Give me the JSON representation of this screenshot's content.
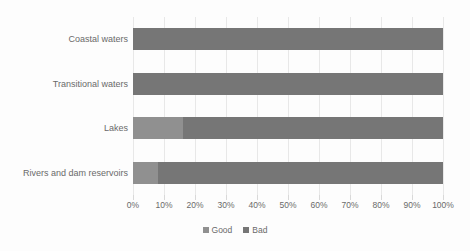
{
  "chart_data": {
    "type": "bar",
    "subtype": "stacked-horizontal-100-percent",
    "title": "",
    "subtitle": "",
    "xlabel": "",
    "ylabel": "",
    "xlim": [
      0,
      100
    ],
    "grid": true,
    "legend_position": "bottom-center",
    "categories": [
      "Coastal waters",
      "Transitional waters",
      "Lakes",
      "Rivers and dam reservoirs"
    ],
    "series": [
      {
        "name": "Good",
        "color": "#909090",
        "values": [
          0,
          0,
          16,
          8
        ]
      },
      {
        "name": "Bad",
        "color": "#767676",
        "values": [
          100,
          100,
          84,
          92
        ]
      }
    ],
    "xticks": [
      0,
      10,
      20,
      30,
      40,
      50,
      60,
      70,
      80,
      90,
      100
    ],
    "xtick_labels": [
      "0%",
      "10%",
      "20%",
      "30%",
      "40%",
      "50%",
      "60%",
      "70%",
      "80%",
      "90%",
      "100%"
    ]
  },
  "legend": {
    "items": [
      {
        "label": "Good",
        "color": "#909090",
        "marker": "square-marker-icon"
      },
      {
        "label": "Bad",
        "color": "#767676",
        "marker": "square-marker-icon"
      }
    ]
  },
  "colors": {
    "background": "#fdfdfd",
    "gridline": "#e8e8e8",
    "tick": "#d9d9d9",
    "text": "#6a6a6a",
    "good": "#909090",
    "bad": "#767676"
  }
}
